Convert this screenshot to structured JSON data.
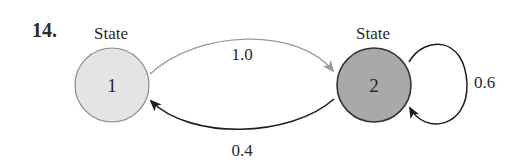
{
  "problem_number": "14.",
  "diagram": {
    "type": "state-transition",
    "states": [
      {
        "id": "1",
        "title": "State",
        "label": "1",
        "fill": "#e4e4e4"
      },
      {
        "id": "2",
        "title": "State",
        "label": "2",
        "fill": "#a9a9a9"
      }
    ],
    "transitions": [
      {
        "from": "1",
        "to": "2",
        "probability": "1.0",
        "color": "#9a9a9a"
      },
      {
        "from": "2",
        "to": "1",
        "probability": "0.4",
        "color": "#1e1e1e"
      },
      {
        "from": "2",
        "to": "2",
        "probability": "0.6",
        "color": "#1e1e1e"
      }
    ]
  }
}
